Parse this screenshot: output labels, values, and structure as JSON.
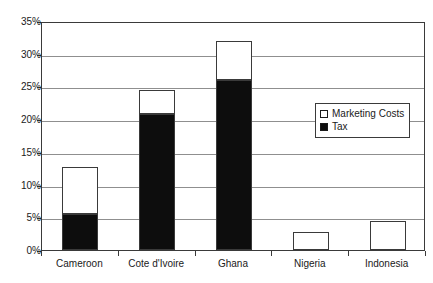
{
  "chart_data": {
    "type": "bar",
    "title": "",
    "xlabel": "",
    "ylabel": "",
    "stacked": true,
    "grid": true,
    "ylim": [
      0,
      35
    ],
    "ytick_step": 5,
    "ytick_labels": [
      "0%",
      "5%",
      "10%",
      "15%",
      "20%",
      "25%",
      "30%",
      "35%"
    ],
    "categories": [
      "Cameroon",
      "Cote d'Ivoire",
      "Ghana",
      "Nigeria",
      "Indonesia"
    ],
    "series": [
      {
        "name": "Tax",
        "color": "#0d0d0d",
        "values": [
          5.5,
          20.8,
          26.0,
          0,
          0
        ]
      },
      {
        "name": "Marketing Costs",
        "color": "#ffffff",
        "values": [
          7.2,
          3.7,
          5.9,
          2.8,
          4.4
        ]
      }
    ],
    "totals": [
      12.7,
      24.5,
      31.9,
      2.8,
      4.4
    ],
    "legend": {
      "position": "inside-right",
      "entries": [
        {
          "label": "Marketing Costs",
          "swatch": "white-square",
          "color": "#ffffff"
        },
        {
          "label": "Tax",
          "swatch": "black-square",
          "color": "#0d0d0d"
        }
      ]
    }
  }
}
